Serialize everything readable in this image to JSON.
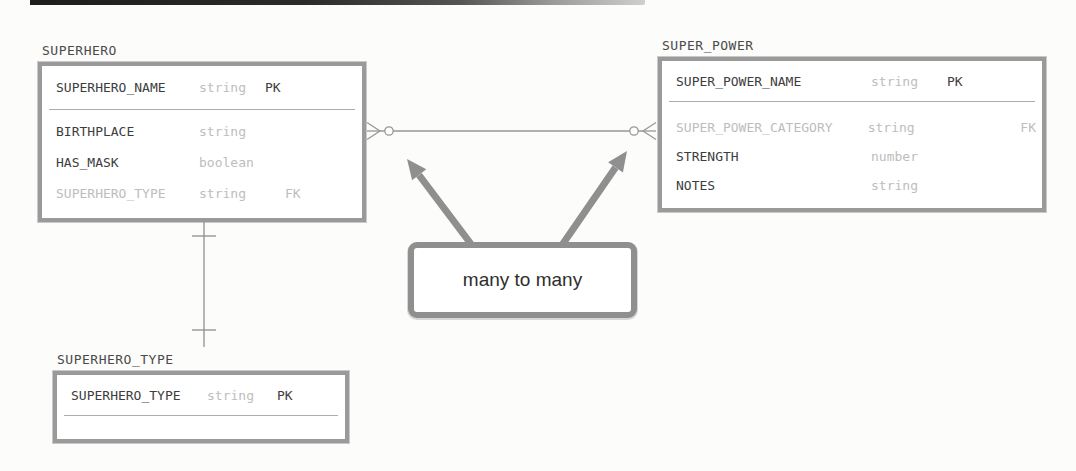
{
  "figure": {
    "kind": "entity-relationship-diagram"
  },
  "colors": {
    "background": "#fcfcfb",
    "table_border": "#9a9a9a",
    "text_dark": "#3d3d3d",
    "text_muted": "#bdbdbd",
    "connector": "#8f8f8f",
    "callout_border": "#8f8f8f",
    "scan_bar_dark": "#1d1d1d"
  },
  "tables": {
    "superhero": {
      "title": "SUPERHERO",
      "header": {
        "name": "SUPERHERO_NAME",
        "type": "string",
        "key": "PK"
      },
      "rows": [
        {
          "name": "BIRTHPLACE",
          "type": "string",
          "key": ""
        },
        {
          "name": "HAS_MASK",
          "type": "boolean",
          "key": ""
        },
        {
          "name": "SUPERHERO_TYPE",
          "type": "string",
          "key": "FK"
        }
      ]
    },
    "super_power": {
      "title": "SUPER_POWER",
      "header": {
        "name": "SUPER_POWER_NAME",
        "type": "string",
        "key": "PK"
      },
      "rows": [
        {
          "name": "SUPER_POWER_CATEGORY",
          "type": "string",
          "key": "FK"
        },
        {
          "name": "STRENGTH",
          "type": "number",
          "key": ""
        },
        {
          "name": "NOTES",
          "type": "string",
          "key": ""
        }
      ]
    },
    "superhero_type": {
      "title": "SUPERHERO_TYPE",
      "header": {
        "name": "SUPERHERO_TYPE",
        "type": "string",
        "key": "PK"
      },
      "rows": []
    }
  },
  "relationships": [
    {
      "from": "SUPERHERO",
      "to": "SUPER_POWER",
      "cardinality": "many to many",
      "notation": "zero-or-many (circle + crow's foot) on both ends"
    },
    {
      "from": "SUPERHERO",
      "to": "SUPERHERO_TYPE",
      "cardinality": "one to one",
      "notation": "single tick on both ends"
    }
  ],
  "callout": {
    "label": "many to many"
  }
}
